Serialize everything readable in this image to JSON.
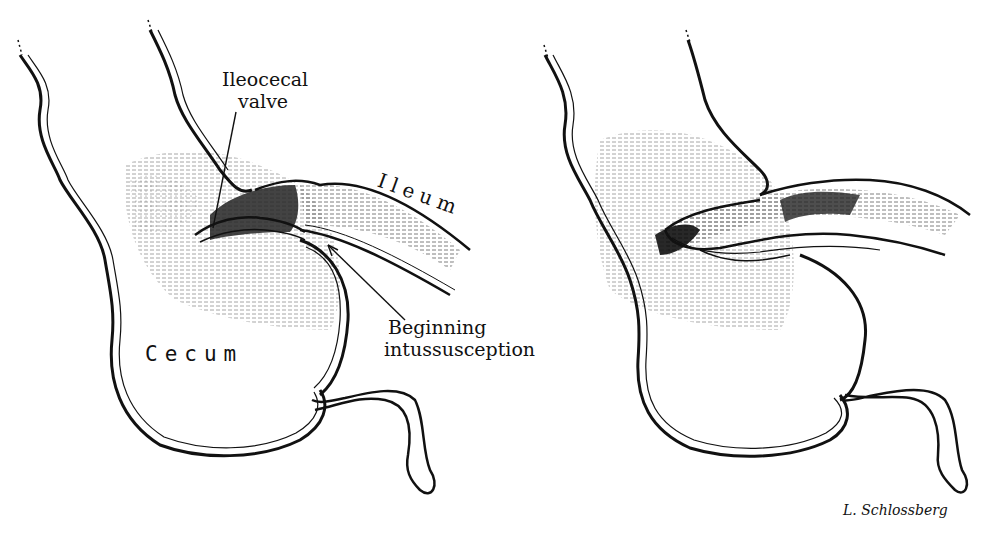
{
  "figure": {
    "panels": [
      {
        "id": "left",
        "description": "Cecum with beginning ileocecal intussusception",
        "labels": {
          "ileocecal_valve_line1": "Ileocecal",
          "ileocecal_valve_line2": "valve",
          "ileum": "Ileum",
          "beginning_line1": "Beginning",
          "beginning_line2": "intussusception",
          "cecum": "Cecum"
        }
      },
      {
        "id": "right",
        "description": "Ileum invaginated into the cecum (progressed intussusception)",
        "labels": {}
      }
    ],
    "signature": "L. Schlossberg"
  }
}
